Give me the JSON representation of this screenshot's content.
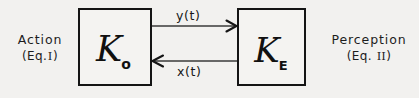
{
  "diagram": {
    "background_color": "#f2f1ef",
    "stroke_color": "#141414",
    "left_label": {
      "name": "Action",
      "equation": "(Eq.",
      "numeral": "I",
      "equation_close": ")"
    },
    "right_label": {
      "name": "Perception",
      "equation": "(Eq.",
      "numeral": "II",
      "equation_close": ")"
    },
    "blocks": [
      {
        "id": "K_o",
        "symbol": "K",
        "subscript": "o",
        "role": "action-operator"
      },
      {
        "id": "K_E",
        "symbol": "K",
        "subscript": "E",
        "role": "perception-operator"
      }
    ],
    "signals": [
      {
        "id": "y",
        "label": "y(t)",
        "direction": "left-to-right",
        "from": "K_o",
        "to": "K_E"
      },
      {
        "id": "x",
        "label": "x(t)",
        "direction": "right-to-left",
        "from": "K_E",
        "to": "K_o"
      }
    ]
  }
}
